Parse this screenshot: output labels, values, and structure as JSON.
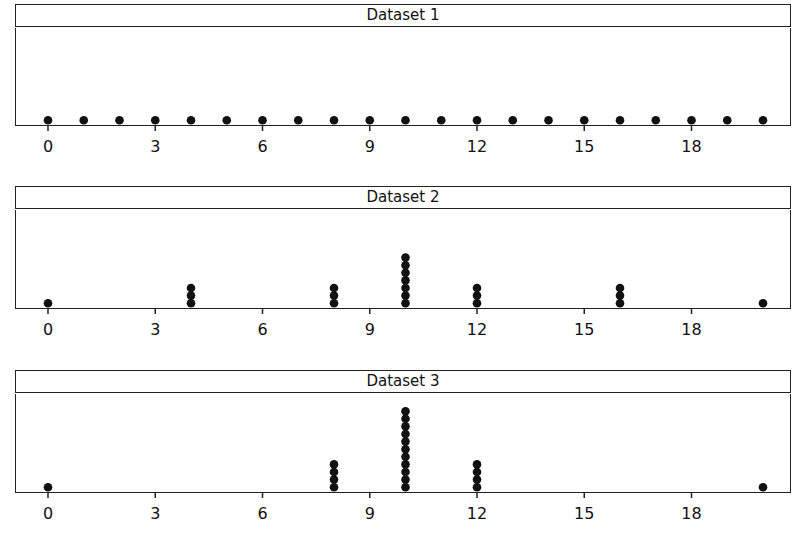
{
  "chart_data": [
    {
      "type": "dot_plot",
      "title": "Dataset 1",
      "xlabel": "",
      "ylabel": "",
      "xlim": [
        -1,
        21
      ],
      "xticks": [
        0,
        3,
        6,
        9,
        12,
        15,
        18
      ],
      "grid": false,
      "points": [
        {
          "x": 0,
          "count": 1
        },
        {
          "x": 1,
          "count": 1
        },
        {
          "x": 2,
          "count": 1
        },
        {
          "x": 3,
          "count": 1
        },
        {
          "x": 4,
          "count": 1
        },
        {
          "x": 5,
          "count": 1
        },
        {
          "x": 6,
          "count": 1
        },
        {
          "x": 7,
          "count": 1
        },
        {
          "x": 8,
          "count": 1
        },
        {
          "x": 9,
          "count": 1
        },
        {
          "x": 10,
          "count": 1
        },
        {
          "x": 11,
          "count": 1
        },
        {
          "x": 12,
          "count": 1
        },
        {
          "x": 13,
          "count": 1
        },
        {
          "x": 14,
          "count": 1
        },
        {
          "x": 15,
          "count": 1
        },
        {
          "x": 16,
          "count": 1
        },
        {
          "x": 17,
          "count": 1
        },
        {
          "x": 18,
          "count": 1
        },
        {
          "x": 19,
          "count": 1
        },
        {
          "x": 20,
          "count": 1
        }
      ]
    },
    {
      "type": "dot_plot",
      "title": "Dataset 2",
      "xlabel": "",
      "ylabel": "",
      "xlim": [
        -1,
        21
      ],
      "xticks": [
        0,
        3,
        6,
        9,
        12,
        15,
        18
      ],
      "grid": false,
      "points": [
        {
          "x": 0,
          "count": 1
        },
        {
          "x": 4,
          "count": 3
        },
        {
          "x": 8,
          "count": 3
        },
        {
          "x": 10,
          "count": 7
        },
        {
          "x": 12,
          "count": 3
        },
        {
          "x": 16,
          "count": 3
        },
        {
          "x": 20,
          "count": 1
        }
      ]
    },
    {
      "type": "dot_plot",
      "title": "Dataset 3",
      "xlabel": "",
      "ylabel": "",
      "xlim": [
        -1,
        21
      ],
      "xticks": [
        0,
        3,
        6,
        9,
        12,
        15,
        18
      ],
      "grid": false,
      "points": [
        {
          "x": 0,
          "count": 1
        },
        {
          "x": 8,
          "count": 4
        },
        {
          "x": 10,
          "count": 11
        },
        {
          "x": 12,
          "count": 4
        },
        {
          "x": 20,
          "count": 1
        }
      ]
    }
  ],
  "panels": [
    {
      "title": "Dataset 1"
    },
    {
      "title": "Dataset 2"
    },
    {
      "title": "Dataset 3"
    }
  ],
  "style": {
    "dot_color": "#111111",
    "line_color": "#222222",
    "background": "#ffffff"
  }
}
